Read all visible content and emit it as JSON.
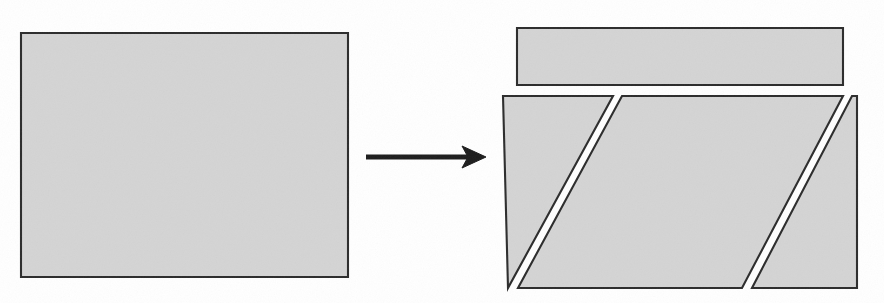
{
  "figure": {
    "background_color": "#ffffff",
    "fill_color": "#d4d4d4",
    "outline_color": "#2b2b2b",
    "arrow_color": "#1c1c1c",
    "canvas": {
      "width": 884,
      "height": 303
    }
  },
  "left_figure": {
    "name": "source-rectangle",
    "label": "rectangle",
    "polygon": "21,33 348,33 348,277 21,277",
    "x": 21,
    "y": 33,
    "width": 327,
    "height": 244
  },
  "arrow": {
    "name": "transformation-arrow",
    "label": "transforms into",
    "line_x1": 366,
    "line_y1": 157,
    "line_x2": 470,
    "line_y2": 157,
    "head_polygon": "486,157 462,146 468,157 462,168",
    "stroke_width": 5.2
  },
  "right_figure": {
    "name": "dissected-result",
    "label": "dissection result",
    "pieces": [
      {
        "name": "top-bar",
        "label": "top rectangular strip",
        "polygon": "517,28 843,28 843,85 517,85"
      },
      {
        "name": "left-triangle",
        "label": "left right-triangle piece",
        "polygon": "503,96 613,96 508,288"
      },
      {
        "name": "center-parallelogram",
        "label": "central parallelogram piece",
        "polygon": "622,96 843,96 742,288 518,288"
      },
      {
        "name": "right-triangle",
        "label": "right right-triangle piece",
        "polygon": "852,96 857,96 857,288 752,288"
      }
    ]
  }
}
